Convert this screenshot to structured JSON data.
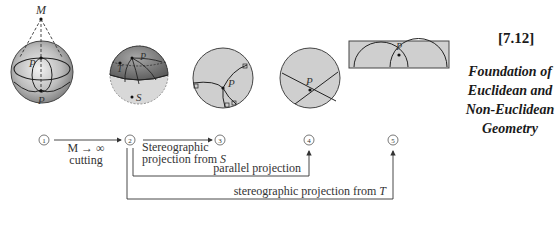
{
  "figure": {
    "number": "[7.12]",
    "book_title_lines": [
      "Foundation of",
      "Euclidean and",
      "Non-Euclidean",
      "Geometry"
    ]
  },
  "stages": [
    {
      "id": "1",
      "label": "1",
      "description": "sphere with center of projection M",
      "point_labels": [
        "M",
        "P",
        "P"
      ]
    },
    {
      "id": "2",
      "label": "2",
      "description": "hemisphere with points T and S",
      "point_labels": [
        "T",
        "P",
        "S"
      ]
    },
    {
      "id": "3",
      "label": "3",
      "description": "disk model with right angles",
      "point_labels": [
        "P"
      ]
    },
    {
      "id": "4",
      "label": "4",
      "description": "disk with straight chords",
      "point_labels": [
        "P"
      ]
    },
    {
      "id": "5",
      "label": "5",
      "description": "half-plane model",
      "point_labels": [
        "P"
      ]
    }
  ],
  "arrows": [
    {
      "from": "1",
      "to": "2",
      "label_top": "M → ∞",
      "label_bottom": "cutting"
    },
    {
      "from": "2",
      "to": "3",
      "label_line1": "Stereographic",
      "label_line2_prefix": "projection from ",
      "label_line2_var": "S"
    },
    {
      "from": "2",
      "to": "4",
      "label": "parallel projection"
    },
    {
      "from": "2",
      "to": "5",
      "label_prefix": "stereographic projection from ",
      "label_var": "T"
    }
  ],
  "colors": {
    "sphere_fill": "#c8c8c8",
    "sphere_dark": "#8a8a8a",
    "line": "#333333",
    "disk_fill": "#cfcfcf"
  }
}
